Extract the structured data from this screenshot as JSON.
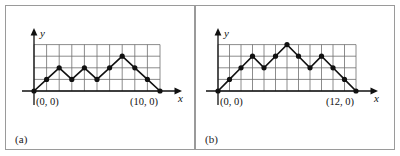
{
  "figure": {
    "background_color": "#ffffff",
    "ink_color": "#111111",
    "grid_color": "#6e6e6e",
    "border_color": "#9a9a9a"
  },
  "panels": [
    {
      "id": "a",
      "sublabel": "(a)",
      "axis_x_label": "x",
      "axis_y_label": "y",
      "origin_label": "(0, 0)",
      "end_label": "(10, 0)",
      "chart_data": {
        "type": "line",
        "title": "",
        "xlabel": "x",
        "ylabel": "y",
        "grid": true,
        "legend": "none",
        "xlim": [
          0,
          10
        ],
        "ylim": [
          0,
          4
        ],
        "x": [
          0,
          1,
          2,
          3,
          4,
          5,
          6,
          7,
          8,
          9,
          10
        ],
        "values": [
          0,
          1,
          2,
          1,
          2,
          1,
          2,
          3,
          2,
          1,
          0
        ],
        "grid_cols": 10,
        "grid_rows": 4,
        "markers": "filled-circle",
        "annotations": [
          "(0, 0)",
          "(10, 0)"
        ]
      }
    },
    {
      "id": "b",
      "sublabel": "(b)",
      "axis_x_label": "x",
      "axis_y_label": "y",
      "origin_label": "(0, 0)",
      "end_label": "(12, 0)",
      "chart_data": {
        "type": "line",
        "title": "",
        "xlabel": "x",
        "ylabel": "y",
        "grid": true,
        "legend": "none",
        "xlim": [
          0,
          12
        ],
        "ylim": [
          0,
          4
        ],
        "x": [
          0,
          1,
          2,
          3,
          4,
          5,
          6,
          7,
          8,
          9,
          10,
          11,
          12
        ],
        "values": [
          0,
          1,
          2,
          3,
          2,
          3,
          4,
          3,
          2,
          3,
          2,
          1,
          0
        ],
        "grid_cols": 12,
        "grid_rows": 4,
        "markers": "filled-circle",
        "annotations": [
          "(0, 0)",
          "(12, 0)"
        ]
      }
    }
  ]
}
